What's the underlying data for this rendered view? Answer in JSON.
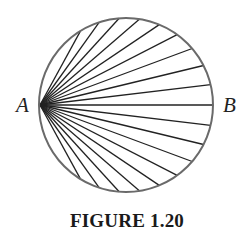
{
  "figure": {
    "caption": "FIGURE 1.20",
    "point_labels": {
      "left": "A",
      "right": "B"
    },
    "circle": {
      "cx": 126,
      "cy": 105,
      "r": 87,
      "stroke": "#6a6a6a",
      "stroke_width": 2
    },
    "chords": {
      "count": 19,
      "from": "A",
      "angle_step_deg": 13.5,
      "stroke": "#222222",
      "stroke_width": 1.3
    }
  }
}
